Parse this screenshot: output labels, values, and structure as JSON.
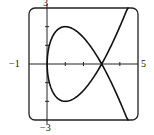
{
  "chart_data": {
    "type": "line",
    "title": "",
    "xlabel": "",
    "ylabel": "",
    "xlim": [
      -1,
      5
    ],
    "ylim": [
      -3,
      3
    ],
    "grid": false,
    "legend": null,
    "tick_labels": {
      "x_min": "−1",
      "x_max": "5",
      "y_max": "3",
      "y_min": "−3"
    },
    "x_ticks": [
      1,
      2,
      3,
      4
    ],
    "y_ticks": [
      -2,
      -1,
      1,
      2
    ],
    "series": [
      {
        "name": "parametric curve x = t^2, y = t^3 - 3t",
        "parametric": {
          "x": "t^2",
          "y": "t^3 - 3t",
          "t_range": [
            -2.11,
            2.11
          ]
        },
        "x": [
          4.45,
          4.0,
          3.61,
          3.24,
          3.0,
          2.56,
          2.25,
          1.69,
          1.44,
          1.0,
          0.64,
          0.36,
          0.16,
          0.04,
          0.0,
          0.04,
          0.16,
          0.36,
          0.64,
          1.0,
          1.44,
          1.69,
          2.25,
          2.56,
          3.0,
          3.24,
          3.61,
          4.0,
          4.45
        ],
        "y": [
          -3.07,
          -2.0,
          -1.16,
          -0.43,
          0.0,
          0.7,
          1.13,
          1.7,
          1.87,
          2.0,
          1.89,
          1.58,
          1.14,
          0.59,
          0.0,
          -0.59,
          -1.14,
          -1.58,
          -1.89,
          -2.0,
          -1.87,
          -1.7,
          -1.13,
          -0.7,
          0.0,
          0.43,
          1.16,
          2.0,
          3.07
        ],
        "color": "#111111"
      }
    ],
    "annotations": []
  }
}
